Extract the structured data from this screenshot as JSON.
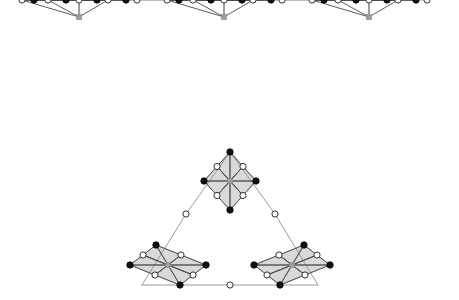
{
  "figure": {
    "title": "Graph diagram: three linked fan clusters and a triangular fractal arrangement",
    "width": 459,
    "height": 300,
    "background": "#ffffff",
    "panels": [
      {
        "name": "top-chain-panel",
        "label": "Three linked fan clusters in a horizontal chain"
      },
      {
        "name": "bottom-triangle-panel",
        "label": "Triangle with three shaded diamond clusters at its corners"
      }
    ]
  },
  "style": {
    "edge_dark": "#4a4a52",
    "edge_gray": "#9a9a9a",
    "edge_light": "#b8b8b8",
    "node_fill_white": "#ffffff",
    "node_fill_black": "#111111",
    "node_fill_gray": "#9e9e9e",
    "node_stroke": "#333333",
    "face_fill": "#d9d9d9",
    "face_stroke": "#6f6f6f",
    "apex_fill": "#9e9e9e",
    "edge_width_dark": 0.9,
    "edge_width_gray": 0.8,
    "edge_width_light": 0.7,
    "node_radius_white": 3.1,
    "node_radius_black": 3.2,
    "apex_size": 5.0
  },
  "chart_data": {
    "type": "diagram",
    "panels": [
      {
        "name": "top-chain",
        "clusters": [
          {
            "index": 0,
            "apex": {
              "x": 79,
              "y": 17,
              "type": "gray-square"
            },
            "open_row_y": 66,
            "open_nodes_x": [
              22,
              48,
              79,
              108,
              137
            ],
            "filled_row_y": 115,
            "filled_nodes_x": [
              34,
              66,
              97,
              126
            ]
          },
          {
            "index": 1,
            "apex": {
              "x": 224,
              "y": 17,
              "type": "gray-square"
            },
            "open_row_y": 66,
            "open_nodes_x": [
              167,
              193,
              224,
              253,
              282
            ],
            "filled_row_y": 115,
            "filled_nodes_x": [
              179,
              211,
              242,
              271
            ]
          },
          {
            "index": 2,
            "apex": {
              "x": 369,
              "y": 17,
              "type": "gray-square"
            },
            "open_row_y": 66,
            "open_nodes_x": [
              312,
              338,
              369,
              398,
              427
            ],
            "filled_row_y": 115,
            "filled_nodes_x": [
              324,
              356,
              387,
              416
            ]
          }
        ],
        "node_counts": {
          "apex": 3,
          "open": 15,
          "filled": 12
        }
      },
      {
        "name": "bottom-triangle",
        "triangle_corners": [
          {
            "x": 230,
            "y": 152
          },
          {
            "x": 142,
            "y": 285
          },
          {
            "x": 318,
            "y": 285
          }
        ],
        "edge_midpoints": [
          {
            "x": 186,
            "y": 214,
            "type": "open"
          },
          {
            "x": 275,
            "y": 214,
            "type": "open"
          },
          {
            "x": 230,
            "y": 285,
            "type": "open"
          }
        ],
        "sub_clusters": [
          {
            "name": "top-diamond",
            "center": {
              "x": 230,
              "y": 181
            },
            "orientation": "upright-rhombus"
          },
          {
            "name": "bottom-left-parallelogram",
            "center": {
              "x": 168,
              "y": 265
            },
            "orientation": "sheared-right"
          },
          {
            "name": "bottom-right-parallelogram",
            "center": {
              "x": 292,
              "y": 265
            },
            "orientation": "sheared-left"
          }
        ]
      }
    ]
  }
}
